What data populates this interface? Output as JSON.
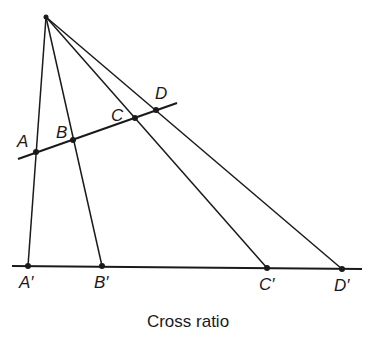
{
  "caption": "Cross ratio",
  "apex": {
    "x": 46,
    "y": 17
  },
  "transversal": {
    "x1": 18,
    "y1": 159,
    "x2": 177,
    "y2": 103
  },
  "baseline": {
    "x1": 12,
    "y1": 266,
    "x2": 362,
    "y2": 269
  },
  "points_upper": [
    {
      "label": "A",
      "x": 36,
      "y": 152
    },
    {
      "label": "B",
      "x": 73,
      "y": 140
    },
    {
      "label": "C",
      "x": 135,
      "y": 118
    },
    {
      "label": "D",
      "x": 156,
      "y": 110
    }
  ],
  "points_lower": [
    {
      "label": "A′",
      "x": 28,
      "y": 266
    },
    {
      "label": "B′",
      "x": 102,
      "y": 266
    },
    {
      "label": "C′",
      "x": 267,
      "y": 268
    },
    {
      "label": "D′",
      "x": 342,
      "y": 269
    }
  ],
  "labels": {
    "A": "A",
    "B": "B",
    "C": "C",
    "D": "D",
    "A_prime": "A′",
    "B_prime": "B′",
    "C_prime": "C′",
    "D_prime": "D′"
  }
}
